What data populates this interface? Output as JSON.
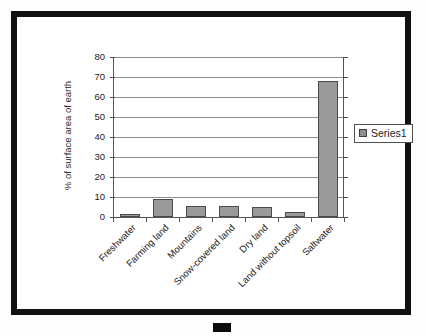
{
  "chart_data": {
    "type": "bar",
    "title": "",
    "xlabel": "",
    "ylabel": "% of surface area of earth",
    "categories": [
      "Freshwater",
      "Farming land",
      "Mountains",
      "Snow-covered land",
      "Dry land",
      "Land without topsoil",
      "Saltwater"
    ],
    "series": [
      {
        "name": "Series1",
        "values": [
          1.5,
          9,
          5.5,
          5.5,
          5,
          2.5,
          68
        ]
      }
    ],
    "ylim": [
      0,
      80
    ],
    "yticks": [
      0,
      10,
      20,
      30,
      40,
      50,
      60,
      70,
      80
    ],
    "ytick_labels": [
      "0",
      "10",
      "20",
      "30",
      "40",
      "50",
      "60",
      "70",
      "80"
    ],
    "grid": true,
    "legend_position": "right",
    "bar_color": "#9a9a9a",
    "bar_border_color": "#4a4a4a",
    "axis_color": "#55565a",
    "gridline_color": "#8d8f93",
    "background_color": "#ffffff",
    "border_color": "#111111"
  },
  "legend": {
    "entries": [
      {
        "label": "Series1",
        "color": "#8e8e8e"
      }
    ]
  }
}
